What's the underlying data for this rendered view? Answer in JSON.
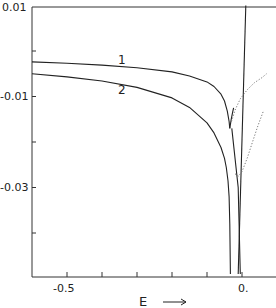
{
  "chart_data": {
    "type": "line",
    "title": "",
    "xlabel": "E",
    "xlabel_arrow": "→",
    "ylabel": "",
    "xlim": [
      -0.6,
      0.1
    ],
    "ylim": [
      -0.05,
      0.01
    ],
    "grid": false,
    "x_ticks": [
      -0.5,
      -0.4,
      -0.3,
      -0.2,
      -0.1,
      0.0
    ],
    "x_tick_labels": [
      {
        "value": -0.5,
        "label": "-0.5"
      },
      {
        "value": 0.0,
        "label": "0."
      }
    ],
    "y_ticks": [
      0.01,
      0.0,
      -0.01,
      -0.02,
      -0.03,
      -0.04
    ],
    "y_tick_labels": [
      {
        "value": 0.01,
        "label": "0.01"
      },
      {
        "value": -0.01,
        "label": "-0.01"
      },
      {
        "value": -0.03,
        "label": "-0.03"
      }
    ],
    "series": [
      {
        "name": "1",
        "style": "solid",
        "points": [
          [
            -0.6,
            -0.0024
          ],
          [
            -0.5,
            -0.0027
          ],
          [
            -0.4,
            -0.0031
          ],
          [
            -0.3,
            -0.0037
          ],
          [
            -0.2,
            -0.0046
          ],
          [
            -0.15,
            -0.0055
          ],
          [
            -0.1,
            -0.0068
          ],
          [
            -0.08,
            -0.0078
          ],
          [
            -0.06,
            -0.0095
          ],
          [
            -0.05,
            -0.011
          ],
          [
            -0.042,
            -0.0132
          ],
          [
            -0.037,
            -0.0155
          ],
          [
            -0.035,
            -0.017
          ]
        ]
      },
      {
        "name": "1-branch",
        "style": "solid",
        "points": [
          [
            -0.035,
            -0.017
          ],
          [
            -0.031,
            -0.015
          ],
          [
            -0.027,
            -0.0135
          ],
          [
            -0.024,
            -0.0125
          ]
        ]
      },
      {
        "name": "2",
        "style": "solid",
        "points": [
          [
            -0.6,
            -0.005
          ],
          [
            -0.5,
            -0.0057
          ],
          [
            -0.4,
            -0.0066
          ],
          [
            -0.3,
            -0.008
          ],
          [
            -0.2,
            -0.0103
          ],
          [
            -0.15,
            -0.0124
          ],
          [
            -0.1,
            -0.0158
          ],
          [
            -0.08,
            -0.018
          ],
          [
            -0.06,
            -0.0212
          ],
          [
            -0.05,
            -0.0236
          ],
          [
            -0.045,
            -0.0256
          ],
          [
            -0.04,
            -0.0285
          ],
          [
            -0.037,
            -0.032
          ],
          [
            -0.035,
            -0.038
          ],
          [
            -0.033,
            -0.049
          ]
        ]
      },
      {
        "name": "steep-line-a",
        "style": "solid",
        "points": [
          [
            0.011,
            0.01
          ],
          [
            -0.011,
            -0.049
          ]
        ]
      },
      {
        "name": "steep-line-b",
        "style": "solid",
        "points": [
          [
            -0.029,
            -0.017
          ],
          [
            -0.011,
            -0.03
          ],
          [
            -0.005,
            -0.049
          ]
        ]
      },
      {
        "name": "dotted-upper",
        "style": "dotted",
        "points": [
          [
            -0.03,
            -0.0155
          ],
          [
            -0.02,
            -0.013
          ],
          [
            -0.005,
            -0.0105
          ],
          [
            0.015,
            -0.0085
          ],
          [
            0.035,
            -0.007
          ],
          [
            0.058,
            -0.0058
          ],
          [
            0.07,
            -0.005
          ]
        ]
      },
      {
        "name": "dotted-lower",
        "style": "dotted",
        "points": [
          [
            -0.02,
            -0.027
          ],
          [
            -0.01,
            -0.0275
          ],
          [
            0.0,
            -0.0265
          ],
          [
            0.015,
            -0.0235
          ],
          [
            0.03,
            -0.02
          ],
          [
            0.045,
            -0.0165
          ],
          [
            0.062,
            -0.013
          ]
        ]
      }
    ],
    "annotations": [
      {
        "text": "1",
        "x": -0.345,
        "y": -0.001
      },
      {
        "text": "2",
        "x": -0.345,
        "y": -0.01
      }
    ]
  },
  "labels": {
    "curve_1": "1",
    "curve_2": "2",
    "x_axis_title": "E",
    "tick_m05": "-0.5",
    "tick_0": "0.",
    "tick_y_001": "0.01",
    "tick_y_m001": "-0.01",
    "tick_y_m003": "-0.03"
  },
  "colors": {
    "line": "#222222",
    "dotted": "#777777",
    "axis": "#333333"
  }
}
